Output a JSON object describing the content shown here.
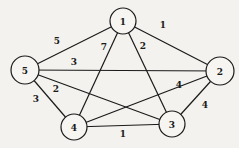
{
  "diagram": {
    "type": "weighted-undirected-graph",
    "nodes": [
      {
        "id": "1",
        "label": "1",
        "x": 123,
        "y": 21,
        "r": 13
      },
      {
        "id": "2",
        "label": "2",
        "x": 220,
        "y": 71,
        "r": 14
      },
      {
        "id": "3",
        "label": "3",
        "x": 172,
        "y": 124,
        "r": 13
      },
      {
        "id": "4",
        "label": "4",
        "x": 74,
        "y": 127,
        "r": 13
      },
      {
        "id": "5",
        "label": "5",
        "x": 25,
        "y": 70,
        "r": 14
      }
    ],
    "edges": [
      {
        "from": "1",
        "to": "5",
        "weight": "5",
        "lx": 57,
        "ly": 44
      },
      {
        "from": "1",
        "to": "2",
        "weight": "1",
        "lx": 163,
        "ly": 28
      },
      {
        "from": "1",
        "to": "4",
        "weight": "7",
        "lx": 104,
        "ly": 50
      },
      {
        "from": "1",
        "to": "3",
        "weight": "2",
        "lx": 143,
        "ly": 49
      },
      {
        "from": "5",
        "to": "2",
        "weight": "3",
        "lx": 74,
        "ly": 65
      },
      {
        "from": "5",
        "to": "3",
        "weight": "2",
        "lx": 56,
        "ly": 92
      },
      {
        "from": "5",
        "to": "4",
        "weight": "3",
        "lx": 36,
        "ly": 102
      },
      {
        "from": "2",
        "to": "4",
        "weight": "4",
        "lx": 179,
        "ly": 88
      },
      {
        "from": "2",
        "to": "3",
        "weight": "4",
        "lx": 205,
        "ly": 108
      },
      {
        "from": "4",
        "to": "3",
        "weight": "1",
        "lx": 123,
        "ly": 137
      }
    ]
  }
}
